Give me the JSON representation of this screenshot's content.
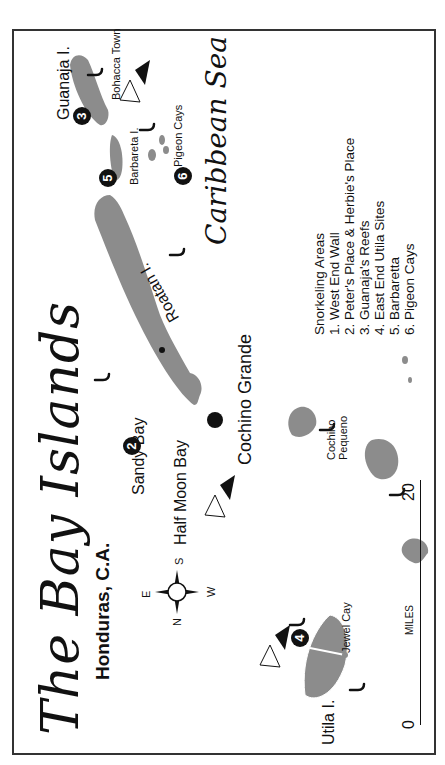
{
  "map": {
    "title": "The Bay Islands",
    "subtitle": "Honduras, C.A.",
    "sea_label": "Caribbean Sea",
    "compass": {
      "n": "N",
      "e": "E",
      "s": "S",
      "w": "W"
    },
    "scale": {
      "start": "0",
      "end": "20",
      "unit": "MILES"
    },
    "islands": [
      {
        "name": "Utila I."
      },
      {
        "name": "Roatan I."
      },
      {
        "name": "Barbareta I."
      },
      {
        "name": "Guanaja I."
      },
      {
        "name": "Cochino Grande"
      },
      {
        "name": "Cochino Pequeno"
      }
    ],
    "places": {
      "jewel_cay": "Jewel Cay",
      "sandy_bay": "Sandy Bay",
      "half_moon_bay": "Half Moon Bay",
      "pigeon_cays": "Pigeon Cays",
      "bohacca_town": "Bohacca Town"
    },
    "markers": [
      "1",
      "2",
      "3",
      "4",
      "5",
      "6"
    ],
    "legend": {
      "title": "Snorkeling Areas",
      "items": [
        "1. West End Wall",
        "2. Peter's Place & Herbie's Place",
        "3. Guanaja's Reefs",
        "4. East End Utila Sites",
        "5. Barbaretta",
        "6. Pigeon Cays"
      ]
    },
    "colors": {
      "land": "#8c8c8c",
      "ink": "#111111",
      "frame": "#333333"
    }
  }
}
